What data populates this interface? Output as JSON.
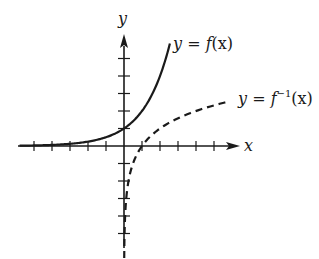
{
  "chart_data": {
    "type": "line",
    "title": "",
    "xlabel": "x",
    "ylabel": "y",
    "xlim": [
      -5.1,
      6.5
    ],
    "ylim": [
      -6.4,
      6.2
    ],
    "x_ticks": [
      -5,
      -4,
      -3,
      -2,
      -1,
      1,
      2,
      3,
      4,
      5
    ],
    "y_ticks": [
      -5,
      -4,
      -3,
      -2,
      -1,
      1,
      2,
      3,
      4,
      5
    ],
    "grid": false,
    "series": [
      {
        "name": "y = f(x)",
        "style": "solid",
        "function": "2^x",
        "x": [
          -5.8,
          -5,
          -4,
          -3,
          -2,
          -1,
          0,
          0.5,
          1,
          1.5,
          2,
          2.3,
          2.55
        ],
        "y": [
          0.018,
          0.031,
          0.063,
          0.125,
          0.25,
          0.5,
          1,
          1.41,
          2,
          2.83,
          4,
          4.92,
          5.86
        ]
      },
      {
        "name": "y = f⁻¹(x)",
        "style": "dashed",
        "function": "log2(x)",
        "x": [
          0.012,
          0.03,
          0.0625,
          0.125,
          0.25,
          0.5,
          1,
          1.5,
          2,
          3,
          4,
          5,
          5.9
        ],
        "y": [
          -6.4,
          -5.06,
          -4,
          -3,
          -2,
          -1,
          0,
          0.58,
          1,
          1.58,
          2,
          2.32,
          2.56
        ]
      }
    ],
    "annotations": [
      {
        "label_parts": {
          "pre": "y = ",
          "func": "f",
          "sup": "",
          "post": "(x)"
        },
        "series": "y = f(x)"
      },
      {
        "label_parts": {
          "pre": "y = ",
          "func": "f",
          "sup": "−1",
          "post": "(x)"
        },
        "series": "y = f⁻¹(x)"
      }
    ]
  },
  "labels": {
    "x_axis": "x",
    "y_axis": "y",
    "f_pre": "y = ",
    "f_func": "f",
    "f_post": "(x)",
    "finv_pre": "y = ",
    "finv_func": "f",
    "finv_sup": "−1",
    "finv_post": "(x)"
  }
}
